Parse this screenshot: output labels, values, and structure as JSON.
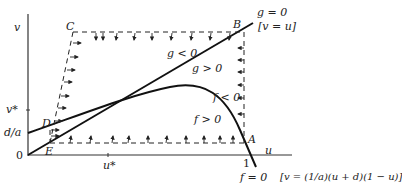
{
  "diagram": {
    "axes": {
      "x_label": "u",
      "y_label": "v",
      "origin_label": "0",
      "x_ticks": [
        {
          "label": "u*",
          "value": "u*"
        },
        {
          "label": "1",
          "value": 1
        }
      ],
      "y_ticks": [
        {
          "label": "v*",
          "value": "v*"
        },
        {
          "label": "d/a",
          "value": "d/a"
        }
      ]
    },
    "points": {
      "A": "A",
      "B": "B",
      "C": "C",
      "D": "D",
      "E": "E"
    },
    "curves": {
      "g_null": {
        "label": "g = 0",
        "equation": "[v = u]"
      },
      "f_null": {
        "label": "f = 0",
        "equation": "[v = (1/a)(u + d)(1 − u)]"
      }
    },
    "regions": {
      "g_neg": "g < 0",
      "g_pos": "g > 0",
      "f_neg": "f < 0",
      "f_pos": "f > 0"
    },
    "colors": {
      "line": "#111111",
      "text": "#222222",
      "background": "#ffffff"
    }
  }
}
